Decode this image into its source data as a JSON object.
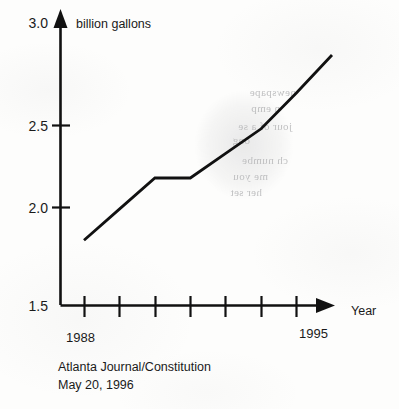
{
  "chart_data": {
    "type": "line",
    "title": "",
    "subtitle": "",
    "xlabel": "Year",
    "ylabel": "billion gallons",
    "x": [
      1988,
      1989,
      1990,
      1991,
      1992,
      1993,
      1994,
      1995
    ],
    "values": [
      1.8,
      1.99,
      2.18,
      2.18,
      2.33,
      2.48,
      2.7,
      2.93
    ],
    "series": [
      {
        "name": "billion gallons",
        "values": [
          1.8,
          1.99,
          2.18,
          2.18,
          2.33,
          2.48,
          2.7,
          2.93
        ]
      }
    ],
    "xlim": [
      1988,
      1995
    ],
    "ylim": [
      1.5,
      3.0
    ],
    "y_ticks": [
      "1.5",
      "2.0",
      "2.5",
      "3.0"
    ],
    "y_tick_values": [
      1.5,
      2.0,
      2.5,
      3.0
    ],
    "x_tick_count": 7,
    "x_visible_tick_labels": [
      "1988",
      "1995"
    ],
    "grid": false,
    "legend": false,
    "line_color": "#111111",
    "axis_color": "#111111",
    "background_color": "#fdfdfc"
  },
  "axes": {
    "y_axis_title": "billion gallons",
    "x_axis_title": "Year",
    "y_tick_labels": [
      "3.0",
      "2.5",
      "2.0",
      "1.5"
    ],
    "x_start_label": "1988",
    "x_end_label": "1995"
  },
  "source": {
    "publication": "Atlanta Journal/Constitution",
    "date": "May 20, 1996"
  },
  "bleed_through": {
    "note": "faint mirrored text bleeding through from reverse side of page",
    "fragments": [
      "newspape",
      "n emp",
      "jour of a se",
      "ong",
      "ch numbe",
      "me you",
      "her set"
    ]
  }
}
